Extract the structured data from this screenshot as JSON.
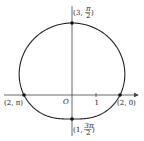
{
  "diagram": {
    "type": "polar-curve",
    "equation": "r = 2 + sin θ",
    "origin_label": "O",
    "tick_label": "1",
    "points": [
      {
        "id": "top",
        "r": "3",
        "theta": "π/2",
        "label_r": "3,",
        "label_num": "π",
        "label_den": "2"
      },
      {
        "id": "left",
        "r": "2",
        "theta": "π",
        "label": "(2, π)"
      },
      {
        "id": "right",
        "r": "2",
        "theta": "0",
        "label": "(2, 0)"
      },
      {
        "id": "bottom",
        "r": "1",
        "theta": "3π/2",
        "label_r": "1,",
        "label_num": "3π",
        "label_den": "2"
      }
    ],
    "colors": {
      "curve": "#222222",
      "axis": "#444444",
      "point": "#111111"
    }
  }
}
